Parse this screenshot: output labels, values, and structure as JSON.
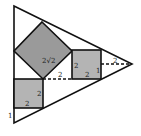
{
  "diagram": {
    "colors": {
      "stroke": "#111111",
      "square_fill": "#b4b4b4",
      "diamond_fill": "#9a9a9a",
      "background": "#ffffff"
    },
    "triangle": {
      "points": [
        [
          14,
          6
        ],
        [
          132,
          64
        ],
        [
          14,
          123
        ]
      ]
    },
    "diamond": {
      "points": [
        [
          42,
          22
        ],
        [
          72,
          51
        ],
        [
          43,
          79
        ],
        [
          14,
          51
        ]
      ],
      "label": "2√2"
    },
    "right_square": {
      "x": 72,
      "y": 50,
      "w": 29,
      "h": 29,
      "labels": {
        "left": "2",
        "bottom": "2",
        "right": "1"
      }
    },
    "left_square": {
      "x": 14,
      "y": 79,
      "w": 29,
      "h": 29,
      "labels": {
        "right": "2",
        "bottom": "2"
      }
    },
    "dashed_lines": [
      {
        "x1": 43,
        "y1": 79,
        "x2": 72,
        "y2": 79,
        "label": "2"
      },
      {
        "x1": 101,
        "y1": 64,
        "x2": 132,
        "y2": 64,
        "label": "2"
      }
    ],
    "side_label": "1"
  }
}
